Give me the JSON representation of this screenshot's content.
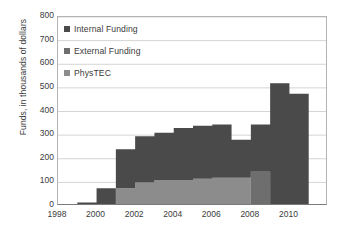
{
  "chart_data": {
    "type": "area",
    "title": "",
    "xlabel": "",
    "ylabel": "Funds, in thousands of dollars",
    "stacked": true,
    "grid": true,
    "legend_position": "top-left",
    "xlim": [
      1998,
      2012
    ],
    "ylim": [
      0,
      800
    ],
    "ytick_values": [
      0,
      100,
      200,
      300,
      400,
      500,
      600,
      700,
      800
    ],
    "ytick_labels": [
      "0",
      "100",
      "200",
      "300",
      "400",
      "500",
      "600",
      "700",
      "800"
    ],
    "xtick_values": [
      1998,
      2000,
      2002,
      2004,
      2006,
      2008,
      2010
    ],
    "xtick_labels": [
      "1998",
      "2000",
      "2002",
      "2004",
      "2006",
      "2008",
      "2010"
    ],
    "x": [
      1998,
      1999,
      2000,
      2001,
      2002,
      2003,
      2004,
      2005,
      2006,
      2007,
      2008,
      2009,
      2010,
      2011,
      2012
    ],
    "series": [
      {
        "name": "PhysTEC",
        "color": "#8c8c8c",
        "values": [
          0,
          0,
          0,
          75,
          100,
          110,
          110,
          115,
          120,
          120,
          0,
          0,
          0,
          0,
          0
        ]
      },
      {
        "name": "External Funding",
        "color": "#6e6e6e",
        "values": [
          0,
          0,
          0,
          0,
          0,
          0,
          0,
          0,
          0,
          0,
          145,
          0,
          0,
          0,
          0
        ]
      },
      {
        "name": "Internal Funding",
        "color": "#4a4a4a",
        "values": [
          0,
          15,
          75,
          165,
          195,
          200,
          220,
          225,
          225,
          160,
          200,
          520,
          475,
          0,
          0
        ]
      }
    ],
    "stack_totals": [
      0,
      15,
      75,
      240,
      295,
      310,
      330,
      340,
      345,
      280,
      345,
      670,
      565,
      0,
      0
    ]
  },
  "legend": {
    "items": [
      {
        "label": "Internal Funding",
        "color": "#4a4a4a"
      },
      {
        "label": "External Funding",
        "color": "#6e6e6e"
      },
      {
        "label": "PhysTEC",
        "color": "#8c8c8c"
      }
    ]
  },
  "colors": {
    "internal_funding": "#4a4a4a",
    "external_funding": "#6e6e6e",
    "phystec": "#8c8c8c",
    "gridline": "#d4d4d4",
    "axis": "#7a7a7a",
    "text": "#3b3b3b",
    "background": "#ffffff"
  }
}
